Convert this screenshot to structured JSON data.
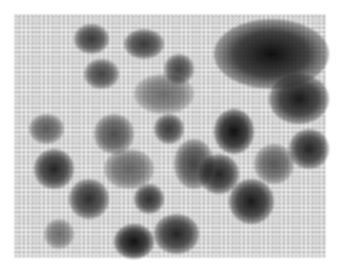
{
  "image": {
    "description": "Grayscale micrograph of clustered dark granular aggregates on white background",
    "background_color": "#ffffff",
    "foreground_color": "#1a1a1a",
    "mid_tone": "#6a6a6a",
    "blobs": [
      {
        "x": 200,
        "y": 5,
        "w": 115,
        "h": 70,
        "o": 0.95
      },
      {
        "x": 255,
        "y": 60,
        "w": 60,
        "h": 50,
        "o": 0.9
      },
      {
        "x": 200,
        "y": 95,
        "w": 40,
        "h": 45,
        "o": 0.95
      },
      {
        "x": 275,
        "y": 115,
        "w": 40,
        "h": 40,
        "o": 0.85
      },
      {
        "x": 185,
        "y": 140,
        "w": 40,
        "h": 40,
        "o": 0.85
      },
      {
        "x": 215,
        "y": 165,
        "w": 45,
        "h": 45,
        "o": 0.9
      },
      {
        "x": 100,
        "y": 210,
        "w": 40,
        "h": 35,
        "o": 0.95
      },
      {
        "x": 140,
        "y": 200,
        "w": 45,
        "h": 40,
        "o": 0.85
      },
      {
        "x": 20,
        "y": 135,
        "w": 40,
        "h": 40,
        "o": 0.85
      },
      {
        "x": 55,
        "y": 165,
        "w": 40,
        "h": 40,
        "o": 0.8
      },
      {
        "x": 120,
        "y": 170,
        "w": 30,
        "h": 30,
        "o": 0.8
      },
      {
        "x": 60,
        "y": 10,
        "w": 35,
        "h": 30,
        "o": 0.75
      },
      {
        "x": 110,
        "y": 15,
        "w": 40,
        "h": 30,
        "o": 0.75
      },
      {
        "x": 70,
        "y": 45,
        "w": 35,
        "h": 30,
        "o": 0.7
      },
      {
        "x": 150,
        "y": 40,
        "w": 30,
        "h": 30,
        "o": 0.7
      },
      {
        "x": 140,
        "y": 100,
        "w": 30,
        "h": 30,
        "o": 0.75
      },
      {
        "x": 80,
        "y": 100,
        "w": 40,
        "h": 40,
        "o": 0.65
      },
      {
        "x": 15,
        "y": 100,
        "w": 35,
        "h": 30,
        "o": 0.6
      },
      {
        "x": 160,
        "y": 125,
        "w": 40,
        "h": 50,
        "o": 0.7
      },
      {
        "x": 90,
        "y": 135,
        "w": 50,
        "h": 40,
        "o": 0.55
      },
      {
        "x": 30,
        "y": 205,
        "w": 30,
        "h": 30,
        "o": 0.5
      },
      {
        "x": 120,
        "y": 60,
        "w": 60,
        "h": 40,
        "o": 0.5
      },
      {
        "x": 240,
        "y": 130,
        "w": 40,
        "h": 40,
        "o": 0.6
      }
    ]
  }
}
